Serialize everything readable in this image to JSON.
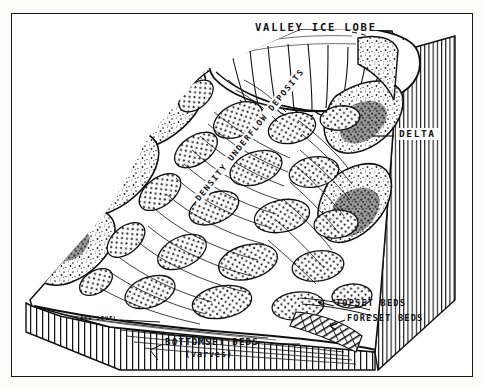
{
  "figure": {
    "kind": "geological-block-diagram",
    "style": "pen-and-ink line drawing, black on white"
  },
  "labels": {
    "valley_ice_lobe": "VALLEY ICE LOBE",
    "delta": "DELTA",
    "density_underflow_deposits": "DENSITY UNDERFLOW DEPOSITS",
    "topset_beds": "TOPSET BEDS",
    "foreset_beds": "FORESET BEDS",
    "bottomset_beds": "BOTTOMSET BEDS",
    "varves": "(varves)",
    "lake_level": "LAKE LEVEL"
  },
  "elements": {
    "ice_lobe": "white lobate glacier tongue with radiating crevasse lines at top center",
    "mountains": "stipple-shaded mountain masses flanking left and right of the valley",
    "delta_plain": "stippled lobate sediment deposits filling the valley floor",
    "right_cliff_face": "vertically hatched cut-away section face on the right",
    "front_cliff_face": "vertically hatched cut-away section face along the front/bottom",
    "lake_surface": "horizontal water line across the lower basin"
  },
  "colors": {
    "ink": "#101114",
    "paper": "#ffffff",
    "page": "#fdfdfb",
    "shade_light": "#b9b9b9",
    "shade_dark": "#6d6d6d"
  }
}
